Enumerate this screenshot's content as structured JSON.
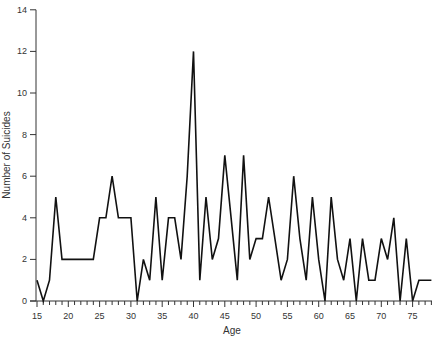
{
  "chart_data": {
    "type": "line",
    "title": "",
    "xlabel": "Age",
    "ylabel": "Number of Suicides",
    "xlim": [
      15,
      78
    ],
    "ylim": [
      0,
      14
    ],
    "grid": false,
    "legend": null,
    "x_ticks": [
      15,
      20,
      25,
      30,
      35,
      40,
      45,
      50,
      55,
      60,
      65,
      70,
      75
    ],
    "y_ticks": [
      0,
      2,
      4,
      6,
      8,
      10,
      12,
      14
    ],
    "x": [
      15,
      16,
      17,
      18,
      19,
      20,
      21,
      22,
      23,
      24,
      25,
      26,
      27,
      28,
      29,
      30,
      31,
      32,
      33,
      34,
      35,
      36,
      37,
      38,
      39,
      40,
      41,
      42,
      43,
      44,
      45,
      46,
      47,
      48,
      49,
      50,
      51,
      52,
      53,
      54,
      55,
      56,
      57,
      58,
      59,
      60,
      61,
      62,
      63,
      64,
      65,
      66,
      67,
      68,
      69,
      70,
      71,
      72,
      73,
      74,
      75,
      76,
      77,
      78
    ],
    "series": [
      {
        "name": "Number of Suicides",
        "color": "#111111",
        "values": [
          1,
          0,
          1,
          5,
          2,
          2,
          2,
          2,
          2,
          2,
          4,
          4,
          6,
          4,
          4,
          4,
          0,
          2,
          1,
          5,
          1,
          4,
          4,
          2,
          6,
          12,
          1,
          5,
          2,
          3,
          7,
          4,
          1,
          7,
          2,
          3,
          3,
          5,
          3,
          1,
          2,
          6,
          3,
          1,
          5,
          2,
          0,
          5,
          2,
          1,
          3,
          0,
          3,
          1,
          1,
          3,
          2,
          4,
          0,
          3,
          0,
          1,
          1,
          1
        ]
      }
    ]
  }
}
